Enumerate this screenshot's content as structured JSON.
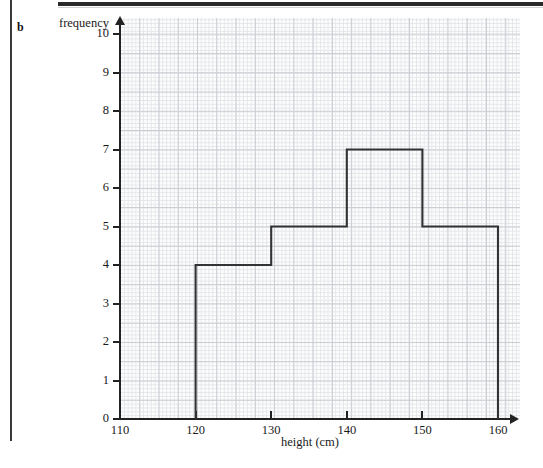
{
  "page": {
    "part_label": "b"
  },
  "chart_data": {
    "type": "bar",
    "subtype": "histogram",
    "title": "",
    "xlabel": "height (cm)",
    "ylabel": "frequency",
    "xlim": [
      110,
      160
    ],
    "ylim": [
      0,
      10
    ],
    "grid": true,
    "grid_style": "graph-paper",
    "legend": "none",
    "x_ticks": [
      "110",
      "120",
      "130",
      "140",
      "150",
      "160"
    ],
    "x_tick_values": [
      110,
      120,
      130,
      140,
      150,
      160
    ],
    "y_ticks": [
      "0",
      "1",
      "2",
      "3",
      "4",
      "5",
      "6",
      "7",
      "8",
      "9",
      "10"
    ],
    "y_tick_values": [
      0,
      1,
      2,
      3,
      4,
      5,
      6,
      7,
      8,
      9,
      10
    ],
    "categories": [
      "120-130",
      "130-140",
      "140-150",
      "150-160"
    ],
    "bin_edges": [
      120,
      130,
      140,
      150,
      160
    ],
    "values": [
      4,
      5,
      7,
      5
    ],
    "bars": [
      {
        "label": "120-130",
        "x_start": 120,
        "x_end": 130,
        "frequency": 4
      },
      {
        "label": "130-140",
        "x_start": 130,
        "x_end": 140,
        "frequency": 5
      },
      {
        "label": "140-150",
        "x_start": 140,
        "x_end": 150,
        "frequency": 7
      },
      {
        "label": "150-160",
        "x_start": 150,
        "x_end": 160,
        "frequency": 5
      }
    ],
    "bar_outline_color": "#333333",
    "bar_fill_color": "none"
  }
}
